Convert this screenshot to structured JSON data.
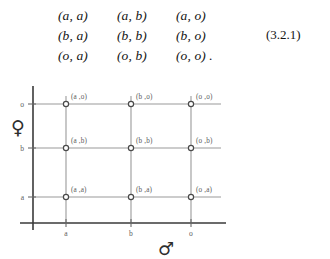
{
  "equation": {
    "rows": [
      [
        "(a, a)",
        "(a, b)",
        "(a, o)"
      ],
      [
        "(b, a)",
        "(b, b)",
        "(b, o)"
      ],
      [
        "(o, a)",
        "(o, b)",
        "(o, o) ."
      ]
    ],
    "number": "(3.2.1)"
  },
  "diagram": {
    "x_axis": {
      "symbol": "♂",
      "symbol_name": "male-symbol",
      "ticks": [
        "a",
        "b",
        "o"
      ]
    },
    "y_axis": {
      "symbol": "♀",
      "symbol_name": "female-symbol",
      "ticks": [
        "a",
        "b",
        "o"
      ]
    },
    "nodes": [
      {
        "label": "(a ,o)",
        "x": "a",
        "y": "o"
      },
      {
        "label": "(b ,o)",
        "x": "b",
        "y": "o"
      },
      {
        "label": "(o ,o)",
        "x": "o",
        "y": "o"
      },
      {
        "label": "(a ,b)",
        "x": "a",
        "y": "b"
      },
      {
        "label": "(b ,b)",
        "x": "b",
        "y": "b"
      },
      {
        "label": "(o ,b)",
        "x": "o",
        "y": "b"
      },
      {
        "label": "(a ,a)",
        "x": "a",
        "y": "a"
      },
      {
        "label": "(b ,a)",
        "x": "b",
        "y": "a"
      },
      {
        "label": "(o ,a)",
        "x": "o",
        "y": "a"
      }
    ],
    "colors": {
      "axis": "#3a3a3a",
      "grid": "#9a9a9a",
      "text": "#5a5a5a",
      "node_stroke": "#4a4a4a"
    }
  }
}
